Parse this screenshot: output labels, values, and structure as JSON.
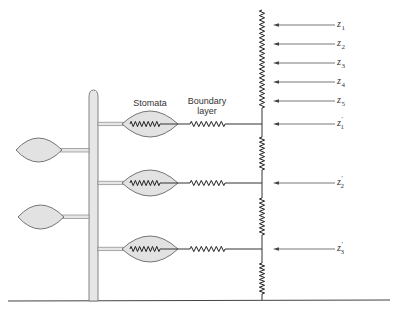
{
  "diagram": {
    "labels": {
      "stomata": "Stomata",
      "boundary_layer_line1": "Boundary",
      "boundary_layer_line2": "layer"
    },
    "height_levels": [
      {
        "id": "z1",
        "symbol": "z",
        "subscript": "1",
        "prime": false
      },
      {
        "id": "z2",
        "symbol": "z",
        "subscript": "2",
        "prime": false
      },
      {
        "id": "z3",
        "symbol": "z",
        "subscript": "3",
        "prime": false
      },
      {
        "id": "z4",
        "symbol": "z",
        "subscript": "4",
        "prime": false
      },
      {
        "id": "z5",
        "symbol": "z",
        "subscript": "5",
        "prime": false
      },
      {
        "id": "z1p",
        "symbol": "z",
        "subscript": "1",
        "prime": true
      },
      {
        "id": "z2p",
        "symbol": "z",
        "subscript": "2",
        "prime": true
      },
      {
        "id": "z3p",
        "symbol": "z",
        "subscript": "3",
        "prime": true
      }
    ],
    "branches": [
      {
        "id": "branch-1",
        "level": "z1p",
        "has_stomata_resistor": true,
        "has_boundary_resistor": true
      },
      {
        "id": "branch-2",
        "level": "z2p",
        "has_stomata_resistor": true,
        "has_boundary_resistor": true
      },
      {
        "id": "branch-3",
        "level": "z3p",
        "has_stomata_resistor": true,
        "has_boundary_resistor": true
      }
    ],
    "left_leaves": 2,
    "colors": {
      "leaf_fill": "#e2e2e2",
      "line": "#333333"
    }
  }
}
